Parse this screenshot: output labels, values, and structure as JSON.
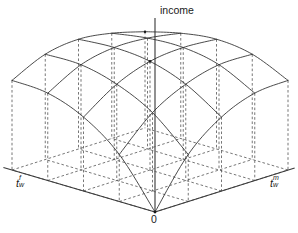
{
  "figure": {
    "kind": "3d-surface-wireframe",
    "width": 298,
    "height": 233,
    "background": "#ffffff",
    "line_color": "#2b2b2b",
    "axis_color": "#3a3a3a",
    "dashed_color": "#4a4a4a"
  },
  "labels": {
    "vertical_axis": "income",
    "origin": "0",
    "left_axis_base": "t",
    "left_axis_sup": "f",
    "left_axis_sub": "w",
    "left_axis_full": "t_w^f",
    "right_axis_base": "t",
    "right_axis_sup": "m",
    "right_axis_sub": "w",
    "right_axis_full": "t_w^m"
  },
  "chart_data": {
    "type": "surface",
    "title": "",
    "xlabel": "t_w^f",
    "ylabel": "t_w^m",
    "zlabel": "income",
    "grid": false,
    "legend": null,
    "nx": 5,
    "ny": 5,
    "x": [
      0,
      0.25,
      0.5,
      0.75,
      1
    ],
    "y": [
      0,
      0.25,
      0.5,
      0.75,
      1
    ],
    "z": [
      [
        0.0,
        0.42,
        0.66,
        0.78,
        0.8
      ],
      [
        0.42,
        0.7,
        0.86,
        0.94,
        0.94
      ],
      [
        0.66,
        0.86,
        0.97,
        1.0,
        0.98
      ],
      [
        0.78,
        0.94,
        1.0,
        0.99,
        0.94
      ],
      [
        0.8,
        0.94,
        0.98,
        0.94,
        0.86
      ]
    ],
    "zlim": [
      0,
      1
    ],
    "projection": {
      "origin_px": [
        155,
        212
      ],
      "left_axis_end_px": [
        12,
        170
      ],
      "right_axis_end_px": [
        288,
        170
      ],
      "vertical_axis_top_px": [
        155,
        18
      ],
      "base_back_corner_px": [
        155,
        128
      ],
      "height_scale_px": 112
    }
  }
}
